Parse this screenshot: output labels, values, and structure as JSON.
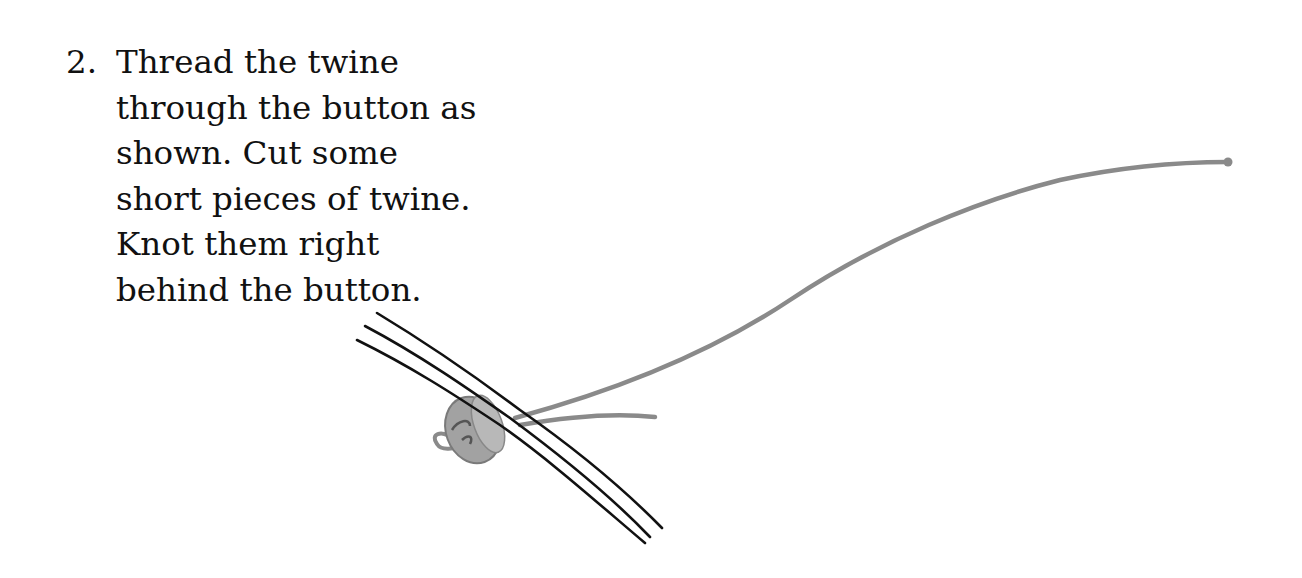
{
  "instruction": {
    "number": "2.",
    "lines": [
      "Thread the twine",
      "through the button as",
      "shown. Cut some",
      "short pieces of twine.",
      "Knot them right",
      "behind the button."
    ]
  },
  "illustration": {
    "subject": "button threaded on twine with short knotted twine pieces",
    "colors": {
      "twine": "#8a8a8a",
      "strands": "#111111",
      "button": "#9a9a9a"
    }
  }
}
